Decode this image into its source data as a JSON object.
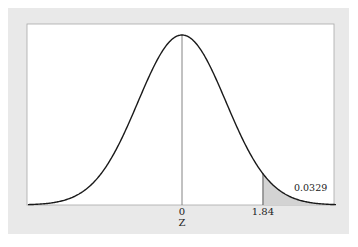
{
  "chart_data": {
    "type": "area",
    "title": "",
    "distribution": "standard normal",
    "xlabel": "Z",
    "ylabel": "",
    "xlim": [
      -3.5,
      3.5
    ],
    "x_ticks": [
      {
        "value": 0,
        "label": "0"
      },
      {
        "value": 1.84,
        "label": "1.84"
      }
    ],
    "shaded_region": {
      "from": 1.84,
      "to": 3.5,
      "area": 0.0329,
      "label": "0.0329"
    },
    "center_line": 0,
    "grid": false,
    "legend": null
  },
  "colors": {
    "frame_bg": "#e9e9e9",
    "plot_bg": "#ffffff",
    "curve": "#1a1a1a",
    "shade": "#d3d3d3",
    "border": "#9a9a9a"
  }
}
